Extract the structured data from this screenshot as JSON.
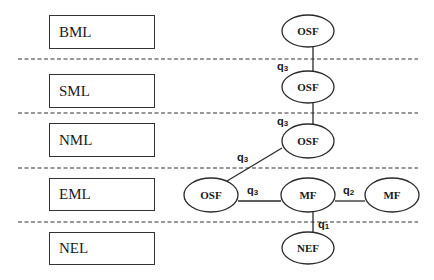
{
  "diagram": {
    "layers": [
      {
        "id": "bml",
        "label": "BML",
        "box": {
          "x": 49,
          "y": 15,
          "w": 106,
          "h": 34
        }
      },
      {
        "id": "sml",
        "label": "SML",
        "box": {
          "x": 49,
          "y": 74,
          "w": 106,
          "h": 34
        }
      },
      {
        "id": "nml",
        "label": "NML",
        "box": {
          "x": 49,
          "y": 123,
          "w": 106,
          "h": 34
        }
      },
      {
        "id": "eml",
        "label": "EML",
        "box": {
          "x": 49,
          "y": 178,
          "w": 106,
          "h": 33
        }
      },
      {
        "id": "nel",
        "label": "NEL",
        "box": {
          "x": 49,
          "y": 232,
          "w": 106,
          "h": 33
        }
      }
    ],
    "separators_y": [
      59,
      113,
      168,
      222
    ],
    "separator_x_range": [
      18,
      418
    ],
    "nodes": [
      {
        "id": "osf_bml",
        "label": "OSF",
        "layer": "BML",
        "cx": 308,
        "cy": 31,
        "rx": 26,
        "ry": 16
      },
      {
        "id": "osf_sml",
        "label": "OSF",
        "layer": "SML",
        "cx": 308,
        "cy": 87,
        "rx": 26,
        "ry": 16
      },
      {
        "id": "osf_nml",
        "label": "OSF",
        "layer": "NML",
        "cx": 308,
        "cy": 141,
        "rx": 26,
        "ry": 17
      },
      {
        "id": "osf_eml",
        "label": "OSF",
        "layer": "EML",
        "cx": 211,
        "cy": 195,
        "rx": 27,
        "ry": 17
      },
      {
        "id": "mf_eml",
        "label": "MF",
        "layer": "EML",
        "cx": 308,
        "cy": 195,
        "rx": 27,
        "ry": 17
      },
      {
        "id": "mf_eml_right",
        "label": "MF",
        "layer": "EML",
        "cx": 392,
        "cy": 195,
        "rx": 27,
        "ry": 17
      },
      {
        "id": "nef_nel",
        "label": "NEF",
        "layer": "NEL",
        "cx": 308,
        "cy": 248,
        "rx": 26,
        "ry": 16
      }
    ],
    "links": [
      {
        "from": "osf_bml",
        "to": "osf_sml",
        "label": "q",
        "sub": "3",
        "x1": 313,
        "y1": 47,
        "x2": 313,
        "y2": 71,
        "lx": 277,
        "ly": 70
      },
      {
        "from": "osf_sml",
        "to": "osf_nml",
        "label": "q",
        "sub": "3",
        "x1": 313,
        "y1": 103,
        "x2": 313,
        "y2": 124,
        "lx": 277,
        "ly": 125
      },
      {
        "from": "osf_nml",
        "to": "osf_eml",
        "label": "q",
        "sub": "3",
        "x1": 282,
        "y1": 148,
        "x2": 227,
        "y2": 181,
        "lx": 237,
        "ly": 161
      },
      {
        "from": "osf_eml",
        "to": "mf_eml",
        "label": "q",
        "sub": "3",
        "x1": 238,
        "y1": 201,
        "x2": 281,
        "y2": 201,
        "lx": 247,
        "ly": 194
      },
      {
        "from": "mf_eml",
        "to": "mf_eml_right",
        "label": "q",
        "sub": "2",
        "x1": 335,
        "y1": 201,
        "x2": 365,
        "y2": 201,
        "lx": 343,
        "ly": 194
      },
      {
        "from": "mf_eml",
        "to": "nef_nel",
        "label": "q",
        "sub": "1",
        "x1": 313,
        "y1": 212,
        "x2": 313,
        "y2": 232,
        "lx": 318,
        "ly": 228
      }
    ]
  },
  "colors": {
    "line": "#2a2a2a",
    "dash": "#333333",
    "text": "#1a1a1a",
    "background": "#ffffff"
  }
}
